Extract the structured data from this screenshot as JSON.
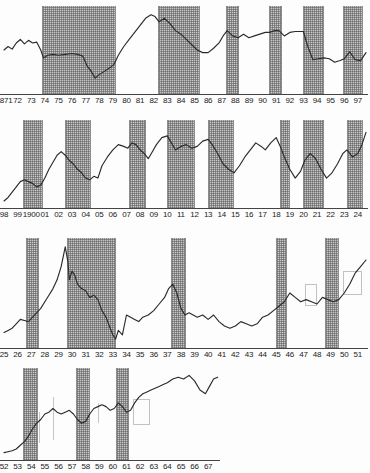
{
  "chart_data": {
    "type": "line",
    "title": "",
    "subtitle": "",
    "xlabel": "",
    "ylabel": "",
    "grid": false,
    "legend": "none",
    "panels": [
      {
        "id": "panel-1",
        "x_start": 1871,
        "x_end": 1897.6,
        "ylim": [
          0,
          100
        ],
        "tick_labels": [
          "1871",
          "72",
          "73",
          "74",
          "75",
          "76",
          "77",
          "78",
          "79",
          "80",
          "81",
          "82",
          "83",
          "84",
          "85",
          "86",
          "87",
          "88",
          "89",
          "90",
          "91",
          "92",
          "93",
          "94",
          "95",
          "96",
          "97"
        ],
        "tick_years": [
          1871,
          1872,
          1873,
          1874,
          1875,
          1876,
          1877,
          1878,
          1879,
          1880,
          1881,
          1882,
          1883,
          1884,
          1885,
          1886,
          1887,
          1888,
          1889,
          1890,
          1891,
          1892,
          1893,
          1894,
          1895,
          1896,
          1897
        ],
        "recessions": [
          {
            "from": 1873.8,
            "to": 1879.2
          },
          {
            "from": 1882.3,
            "to": 1885.4
          },
          {
            "from": 1887.3,
            "to": 1888.3
          },
          {
            "from": 1890.5,
            "to": 1891.4
          },
          {
            "from": 1893.0,
            "to": 1894.5
          },
          {
            "from": 1895.9,
            "to": 1897.4
          }
        ],
        "x": [
          1871.0,
          1871.3,
          1871.6,
          1871.9,
          1872.2,
          1872.5,
          1872.8,
          1873.1,
          1873.4,
          1873.7,
          1873.9,
          1874.2,
          1874.6,
          1875.0,
          1875.5,
          1876.0,
          1876.4,
          1876.8,
          1877.1,
          1877.4,
          1877.7,
          1878.0,
          1878.4,
          1878.8,
          1879.1,
          1879.4,
          1879.8,
          1880.2,
          1880.6,
          1881.0,
          1881.4,
          1881.8,
          1882.1,
          1882.4,
          1882.8,
          1883.2,
          1883.6,
          1884.0,
          1884.4,
          1884.8,
          1885.2,
          1885.6,
          1886.0,
          1886.4,
          1886.8,
          1887.1,
          1887.4,
          1887.8,
          1888.2,
          1888.6,
          1889.0,
          1889.4,
          1889.8,
          1890.2,
          1890.5,
          1890.9,
          1891.2,
          1891.6,
          1892.0,
          1892.4,
          1892.8,
          1893.0,
          1893.3,
          1893.7,
          1894.1,
          1894.5,
          1894.9,
          1895.3,
          1895.7,
          1896.0,
          1896.4,
          1896.8,
          1897.2,
          1897.6
        ],
        "y": [
          50,
          54,
          51,
          58,
          62,
          57,
          61,
          58,
          59,
          50,
          41,
          44,
          45,
          44,
          45,
          46,
          45,
          43,
          32,
          26,
          18,
          22,
          26,
          30,
          34,
          44,
          54,
          62,
          70,
          78,
          86,
          90,
          88,
          82,
          86,
          80,
          72,
          68,
          62,
          56,
          50,
          47,
          47,
          52,
          58,
          66,
          72,
          66,
          64,
          68,
          64,
          66,
          68,
          70,
          70,
          72,
          72,
          66,
          70,
          71,
          71,
          71,
          55,
          39,
          40,
          41,
          40,
          36,
          38,
          40,
          48,
          39,
          38,
          47
        ]
      },
      {
        "id": "panel-2",
        "x_start": 1898,
        "x_end": 1924.6,
        "ylim": [
          0,
          100
        ],
        "tick_labels": [
          "98",
          "99",
          "1900",
          "01",
          "02",
          "03",
          "04",
          "05",
          "06",
          "07",
          "08",
          "09",
          "10",
          "11",
          "12",
          "13",
          "14",
          "15",
          "16",
          "17",
          "18",
          "19",
          "20",
          "21",
          "22",
          "23",
          "24"
        ],
        "tick_years": [
          1898,
          1899,
          1900,
          1901,
          1902,
          1903,
          1904,
          1905,
          1906,
          1907,
          1908,
          1909,
          1910,
          1911,
          1912,
          1913,
          1914,
          1915,
          1916,
          1917,
          1918,
          1919,
          1920,
          1921,
          1922,
          1923,
          1924
        ],
        "recessions": [
          {
            "from": 1899.4,
            "to": 1900.9
          },
          {
            "from": 1902.5,
            "to": 1904.4
          },
          {
            "from": 1907.2,
            "to": 1908.4
          },
          {
            "from": 1910.0,
            "to": 1912.0
          },
          {
            "from": 1913.0,
            "to": 1914.9
          },
          {
            "from": 1918.3,
            "to": 1919.0
          },
          {
            "from": 1920.0,
            "to": 1921.5
          },
          {
            "from": 1923.2,
            "to": 1924.4
          }
        ],
        "x": [
          1898.0,
          1898.3,
          1898.6,
          1898.9,
          1899.2,
          1899.5,
          1899.8,
          1900.1,
          1900.4,
          1900.7,
          1901.0,
          1901.3,
          1901.6,
          1901.9,
          1902.2,
          1902.5,
          1902.8,
          1903.1,
          1903.4,
          1903.7,
          1904.0,
          1904.3,
          1904.6,
          1904.9,
          1905.2,
          1905.6,
          1906.0,
          1906.4,
          1906.8,
          1907.1,
          1907.4,
          1907.7,
          1908.0,
          1908.3,
          1908.6,
          1908.9,
          1909.2,
          1909.6,
          1910.0,
          1910.3,
          1910.6,
          1911.0,
          1911.4,
          1911.8,
          1912.2,
          1912.6,
          1913.0,
          1913.3,
          1913.7,
          1914.1,
          1914.5,
          1914.9,
          1915.3,
          1915.7,
          1916.1,
          1916.5,
          1916.9,
          1917.2,
          1917.6,
          1918.0,
          1918.3,
          1918.6,
          1919.0,
          1919.4,
          1919.8,
          1920.1,
          1920.5,
          1920.9,
          1921.3,
          1921.7,
          1922.1,
          1922.5,
          1922.9,
          1923.2,
          1923.6,
          1924.0,
          1924.3,
          1924.6
        ],
        "y": [
          8,
          12,
          18,
          24,
          30,
          32,
          30,
          28,
          24,
          26,
          34,
          44,
          52,
          60,
          64,
          60,
          54,
          50,
          44,
          40,
          34,
          32,
          36,
          34,
          48,
          58,
          66,
          72,
          70,
          68,
          74,
          72,
          66,
          62,
          56,
          64,
          72,
          80,
          82,
          74,
          66,
          70,
          72,
          68,
          70,
          76,
          78,
          72,
          62,
          50,
          44,
          40,
          48,
          58,
          66,
          74,
          70,
          66,
          74,
          80,
          70,
          58,
          44,
          34,
          42,
          54,
          62,
          56,
          44,
          34,
          40,
          50,
          62,
          66,
          58,
          62,
          72,
          86
        ]
      },
      {
        "id": "panel-3",
        "x_start": 1925,
        "x_end": 1951.6,
        "ylim": [
          0,
          100
        ],
        "tick_labels": [
          "25",
          "26",
          "27",
          "28",
          "29",
          "30",
          "31",
          "32",
          "33",
          "34",
          "35",
          "36",
          "37",
          "38",
          "39",
          "40",
          "41",
          "42",
          "43",
          "44",
          "45",
          "46",
          "47",
          "48",
          "49",
          "50",
          "51"
        ],
        "tick_years": [
          1925,
          1926,
          1927,
          1928,
          1929,
          1930,
          1931,
          1932,
          1933,
          1934,
          1935,
          1936,
          1937,
          1938,
          1939,
          1940,
          1941,
          1942,
          1943,
          1944,
          1945,
          1946,
          1947,
          1948,
          1949,
          1950,
          1951
        ],
        "recessions": [
          {
            "from": 1926.6,
            "to": 1927.6
          },
          {
            "from": 1929.6,
            "to": 1933.2
          },
          {
            "from": 1937.3,
            "to": 1938.4
          },
          {
            "from": 1945.0,
            "to": 1945.8
          },
          {
            "from": 1948.6,
            "to": 1949.6
          }
        ],
        "x": [
          1925.0,
          1925.3,
          1925.6,
          1925.9,
          1926.2,
          1926.5,
          1926.8,
          1927.1,
          1927.4,
          1927.7,
          1928.0,
          1928.3,
          1928.6,
          1928.9,
          1929.2,
          1929.5,
          1929.7,
          1929.8,
          1930.0,
          1930.2,
          1930.4,
          1930.7,
          1931.0,
          1931.3,
          1931.6,
          1931.9,
          1932.2,
          1932.5,
          1932.8,
          1933.0,
          1933.2,
          1933.4,
          1933.7,
          1934.0,
          1934.3,
          1934.6,
          1934.9,
          1935.2,
          1935.6,
          1936.0,
          1936.4,
          1936.8,
          1937.1,
          1937.4,
          1937.7,
          1938.0,
          1938.3,
          1938.6,
          1938.9,
          1939.2,
          1939.6,
          1940.0,
          1940.4,
          1940.8,
          1941.2,
          1941.6,
          1942.0,
          1942.4,
          1942.8,
          1943.2,
          1943.6,
          1944.0,
          1944.4,
          1944.8,
          1945.2,
          1945.6,
          1946.0,
          1946.4,
          1946.8,
          1947.2,
          1947.6,
          1948.0,
          1948.4,
          1948.8,
          1949.2,
          1949.6,
          1950.0,
          1950.4,
          1950.8,
          1951.2,
          1951.6
        ],
        "y": [
          14,
          16,
          18,
          22,
          26,
          25,
          24,
          28,
          32,
          36,
          42,
          48,
          54,
          62,
          74,
          92,
          78,
          62,
          70,
          66,
          58,
          54,
          52,
          46,
          48,
          44,
          34,
          28,
          18,
          12,
          8,
          16,
          12,
          30,
          28,
          26,
          24,
          28,
          30,
          34,
          40,
          46,
          54,
          58,
          50,
          36,
          30,
          32,
          30,
          28,
          30,
          26,
          30,
          24,
          20,
          18,
          20,
          24,
          22,
          20,
          22,
          28,
          30,
          34,
          38,
          42,
          50,
          46,
          42,
          44,
          42,
          40,
          46,
          44,
          42,
          44,
          50,
          58,
          68,
          74,
          80
        ]
      },
      {
        "id": "panel-4",
        "x_start": 1952,
        "x_end": 1978.6,
        "ylim": [
          0,
          100
        ],
        "tick_labels": [
          "52",
          "53",
          "54",
          "55",
          "56",
          "57",
          "58",
          "59",
          "60",
          "61",
          "62",
          "63",
          "64",
          "65",
          "66",
          "67"
        ],
        "tick_years": [
          1952,
          1953,
          1954,
          1955,
          1956,
          1957,
          1958,
          1959,
          1960,
          1961,
          1962,
          1963,
          1964,
          1965,
          1966,
          1967
        ],
        "recessions": [
          {
            "from": 1953.4,
            "to": 1954.5
          },
          {
            "from": 1957.3,
            "to": 1958.3
          },
          {
            "from": 1960.2,
            "to": 1961.2
          }
        ],
        "x": [
          1952.0,
          1952.3,
          1952.6,
          1952.9,
          1953.2,
          1953.5,
          1953.8,
          1954.1,
          1954.4,
          1954.7,
          1955.0,
          1955.3,
          1955.6,
          1955.9,
          1956.2,
          1956.5,
          1956.8,
          1957.1,
          1957.4,
          1957.7,
          1958.0,
          1958.3,
          1958.6,
          1958.9,
          1959.2,
          1959.5,
          1959.8,
          1960.1,
          1960.4,
          1960.7,
          1961.0,
          1961.3,
          1961.6,
          1961.9,
          1962.2,
          1962.5,
          1962.8,
          1963.1,
          1963.4,
          1963.7,
          1964.0,
          1964.4,
          1964.8,
          1965.2,
          1965.6,
          1966.0,
          1966.4,
          1966.8,
          1967.1,
          1967.4,
          1967.7
        ],
        "y": [
          8,
          9,
          10,
          12,
          16,
          20,
          26,
          34,
          40,
          44,
          50,
          52,
          56,
          52,
          50,
          52,
          54,
          50,
          44,
          40,
          42,
          50,
          56,
          58,
          60,
          58,
          54,
          56,
          62,
          58,
          52,
          54,
          62,
          68,
          72,
          74,
          76,
          78,
          80,
          82,
          84,
          88,
          90,
          88,
          92,
          86,
          76,
          72,
          80,
          88,
          90
        ]
      }
    ]
  },
  "annotations": {
    "panel3": [
      {
        "name": "ann-box-1947",
        "x": 1947.1,
        "y_top": 0.42,
        "w_years": 0.9,
        "h_frac": 0.2
      },
      {
        "name": "ann-box-1950",
        "x": 1949.9,
        "y_top": 0.3,
        "w_years": 1.4,
        "h_frac": 0.22
      }
    ],
    "panel4": [
      {
        "name": "ann-box-1962",
        "x": 1961.5,
        "y_top": 0.34,
        "w_years": 1.2,
        "h_frac": 0.28
      }
    ],
    "panel4_ticks": [
      {
        "name": "ann-tick-1955",
        "x": 1954.6,
        "y_top": 0.48,
        "h_frac": 0.34
      },
      {
        "name": "ann-tick-1956",
        "x": 1955.6,
        "y_top": 0.32,
        "h_frac": 0.46
      },
      {
        "name": "ann-tick-1959",
        "x": 1958.9,
        "y_top": 0.38,
        "h_frac": 0.22
      }
    ]
  }
}
